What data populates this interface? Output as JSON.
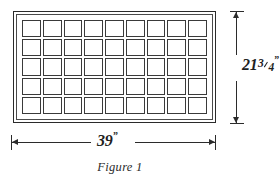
{
  "figure": {
    "caption": "Figure 1",
    "type": "technical-dimension-diagram"
  },
  "panel": {
    "name": "gridded-rectangular-panel",
    "frame_style": "double-line-border"
  },
  "grid": {
    "columns": 9,
    "rows": 5,
    "total_cells": 45,
    "cell_shape": "square"
  },
  "dimensions": {
    "width": {
      "label": "39",
      "unit_mark": "”",
      "value": 39,
      "unit": "inches",
      "orientation": "horizontal",
      "position": "bottom",
      "arrows": "both-ends"
    },
    "height": {
      "whole": "21",
      "numerator": "3",
      "denominator": "4",
      "unit_mark": "”",
      "value": 21.75,
      "unit": "inches",
      "orientation": "vertical",
      "position": "right",
      "arrows": "both-ends"
    }
  },
  "colors": {
    "background": "#ffffff",
    "line": "#2b2b2b",
    "cell_border": "#3a3a3a",
    "text": "#1f1f1f"
  }
}
